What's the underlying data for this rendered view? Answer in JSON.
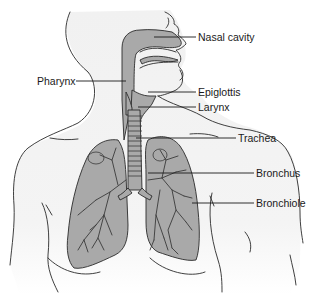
{
  "diagram": {
    "colors": {
      "background": "#ffffff",
      "organ_fill": "#a9a9a9",
      "body_shade": "#f0f0f0",
      "line": "#2a2a2a"
    },
    "labels": {
      "nasal_cavity": "Nasal cavity",
      "pharynx": "Pharynx",
      "epiglottis": "Epiglottis",
      "larynx": "Larynx",
      "trachea": "Trachea",
      "bronchus": "Bronchus",
      "bronchiole": "Bronchiole"
    }
  }
}
